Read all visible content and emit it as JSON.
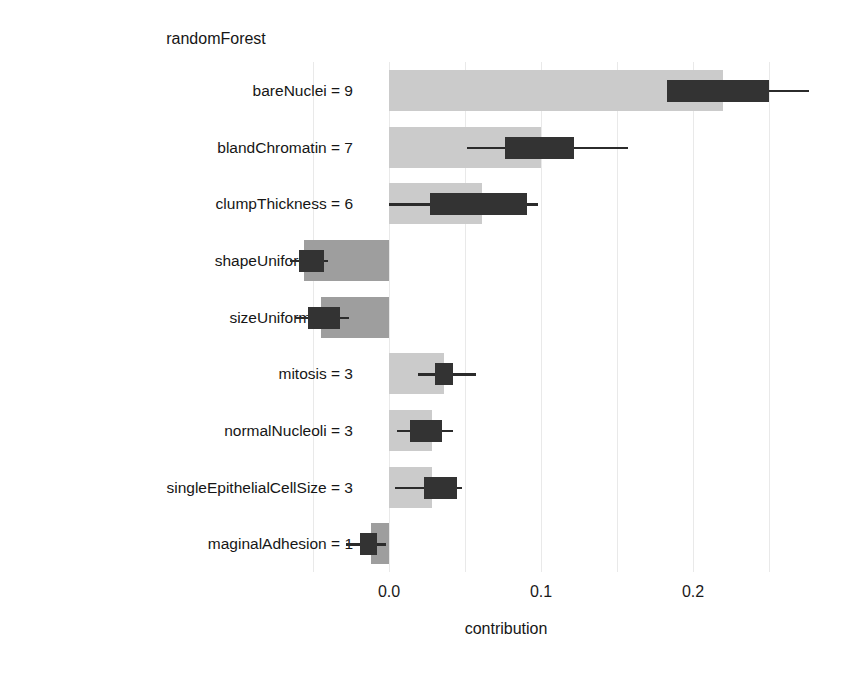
{
  "chart_data": {
    "type": "bar",
    "orientation": "horizontal",
    "title": "randomForest",
    "xlabel": "contribution",
    "ylabel": "",
    "xlim": [
      -0.065,
      0.305
    ],
    "xticks": [
      0.0,
      0.1,
      0.2
    ],
    "xticklabels": [
      "0.0",
      "0.1",
      "0.2"
    ],
    "grid": true,
    "grid_axis": "x",
    "grid_values": [
      -0.05,
      0.0,
      0.05,
      0.1,
      0.15,
      0.2,
      0.25
    ],
    "legend": null,
    "categories": [
      "bareNuclei = 9",
      "blandChromatin = 7",
      "clumpThickness = 6",
      "shapeUniformity = 1",
      "sizeUniformity = 1",
      "mitosis = 3",
      "normalNucleoli = 3",
      "singleEpithelialCellSize = 3",
      "maginalAdhesion = 1"
    ],
    "values": [
      0.22,
      0.1,
      0.061,
      -0.056,
      -0.045,
      0.036,
      0.028,
      0.028,
      -0.012
    ],
    "boxplot": [
      {
        "low": 0.183,
        "q1": 0.183,
        "median": 0.213,
        "q3": 0.25,
        "high": 0.276
      },
      {
        "low": 0.051,
        "q1": 0.076,
        "median": 0.1,
        "q3": 0.122,
        "high": 0.157
      },
      {
        "low": 0.0,
        "q1": 0.027,
        "median": 0.06,
        "q3": 0.091,
        "high": 0.098
      },
      {
        "low": -0.065,
        "q1": -0.059,
        "median": -0.049,
        "q3": -0.043,
        "high": -0.04
      },
      {
        "low": -0.062,
        "q1": -0.053,
        "median": -0.04,
        "q3": -0.032,
        "high": -0.026
      },
      {
        "low": 0.019,
        "q1": 0.03,
        "median": 0.036,
        "q3": 0.042,
        "high": 0.057
      },
      {
        "low": 0.005,
        "q1": 0.014,
        "median": 0.024,
        "q3": 0.035,
        "high": 0.042
      },
      {
        "low": 0.004,
        "q1": 0.023,
        "median": 0.033,
        "q3": 0.045,
        "high": 0.048
      },
      {
        "low": -0.028,
        "q1": -0.019,
        "median": -0.013,
        "q3": -0.008,
        "high": -0.002
      }
    ],
    "colors": {
      "positive_bar": "#cbcbcb",
      "negative_bar": "#9e9e9e",
      "box": "#333333",
      "whisker": "#2b2b2b",
      "grid": "#e9e9e9",
      "text": "#161616",
      "background": "#ffffff"
    }
  }
}
